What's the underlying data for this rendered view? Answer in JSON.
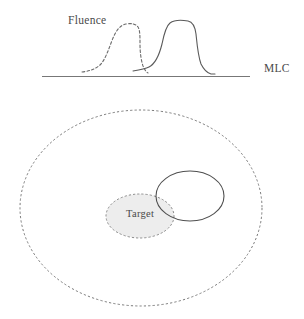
{
  "figure": {
    "title_text": null,
    "labels": {
      "fluence": "Fluence",
      "mlc": "MLC",
      "target": "Target"
    },
    "colors": {
      "curve_solid": "#5a5a5a",
      "curve_dashed": "#6b6b6b",
      "mlc_line": "#777777",
      "outer_contour": "#7a7a7a",
      "target_fill": "#ededed",
      "target_stroke": "#8a8a8a",
      "aperture_stroke": "#4f4f4f",
      "text": "#4a4a4a",
      "background": "#ffffff"
    },
    "panels": {
      "top": {
        "name": "fluence-profile-panel",
        "description": "Two fluence profile curves above a horizontal MLC baseline",
        "baseline": {
          "x1": 42,
          "x2": 250,
          "y": 76
        },
        "curves": [
          {
            "name": "dashed-fluence-curve",
            "style": "dashed",
            "peak_x": 120,
            "peak_y": 24,
            "start_x": 82,
            "end_x": 148
          },
          {
            "name": "solid-fluence-curve",
            "style": "solid",
            "peak_x": 180,
            "peak_y": 22,
            "start_x": 133,
            "end_x": 214
          }
        ]
      },
      "bottom": {
        "name": "anatomy-contour-panel",
        "description": "Outer dashed body contour with shaded target ellipse and solid beam aperture ellipse",
        "shapes": [
          {
            "name": "outer-body-contour",
            "shape": "ellipse",
            "style": "dashed",
            "cx": 141,
            "cy": 208,
            "rx": 121,
            "ry": 98
          },
          {
            "name": "target-ellipse",
            "shape": "ellipse",
            "style": "dashed-filled",
            "cx": 140,
            "cy": 216,
            "rx": 34,
            "ry": 22
          },
          {
            "name": "aperture-ellipse",
            "shape": "ellipse",
            "style": "solid",
            "cx": 190,
            "cy": 196,
            "rx": 34,
            "ry": 25
          }
        ]
      }
    }
  }
}
